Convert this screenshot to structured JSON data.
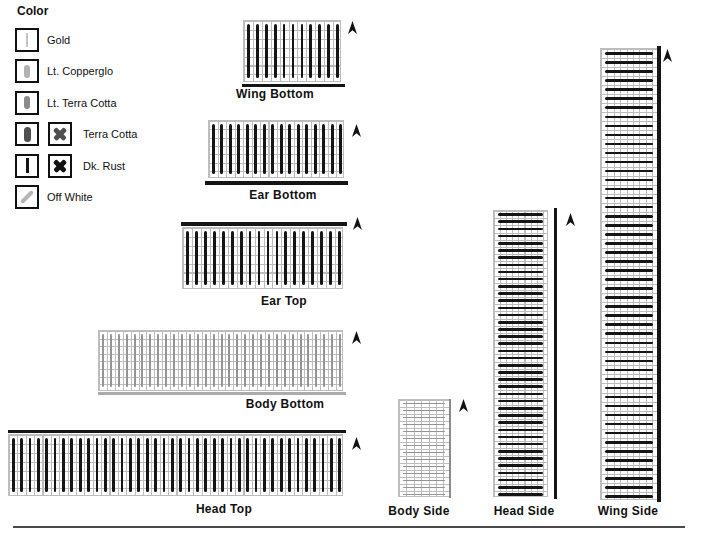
{
  "colors": {
    "background": "#ffffff",
    "text": "#111111",
    "gridline": "#bdbdbd",
    "black_bar": "#151515",
    "light_bar": "#949494",
    "rule": "#4a4a4a",
    "arrow": "#121212"
  },
  "legend": {
    "title": "Color",
    "items": [
      {
        "label": "Gold",
        "swatch": "thin-line",
        "swatch_color": "#c4c4c4",
        "has_x": false
      },
      {
        "label": "Lt. Copperglo",
        "swatch": "pill",
        "swatch_color": "#b3b3b3",
        "has_x": false
      },
      {
        "label": "Lt. Terra Cotta",
        "swatch": "pill",
        "swatch_color": "#8b8b8b",
        "has_x": false
      },
      {
        "label": "Terra Cotta",
        "swatch": "pill-bold",
        "swatch_color": "#4f4f4f",
        "has_x": true,
        "x_color": "#4f4f4f"
      },
      {
        "label": "Dk. Rust",
        "swatch": "bar",
        "swatch_color": "#151515",
        "has_x": true,
        "x_color": "#121212"
      },
      {
        "label": "Off White",
        "swatch": "diagonal",
        "swatch_color": "#b5b5b5",
        "has_x": false
      }
    ]
  },
  "panels": [
    {
      "id": "wing-bottom",
      "label": "Wing Bottom",
      "bar_axis": "vertical",
      "bars": 11,
      "bar_w": 2.8,
      "bar_color": "#151515",
      "grid": {
        "x": 243,
        "y": 20,
        "w": 98,
        "h": 62,
        "cell": 8.9
      },
      "edge_rect": {
        "x": 242,
        "y": 83.5,
        "w": 103,
        "h": 3.5
      },
      "edge_color": "#151515",
      "label_pos": {
        "cx": 275,
        "y": 87
      },
      "arrow": {
        "x": 348,
        "y": 21
      }
    },
    {
      "id": "ear-bottom",
      "label": "Ear Bottom",
      "bar_axis": "vertical",
      "bars": 16,
      "bar_w": 2.8,
      "bar_color": "#151515",
      "grid": {
        "x": 208,
        "y": 120,
        "w": 136,
        "h": 58,
        "cell": 8.3
      },
      "edge_rect": {
        "x": 205,
        "y": 180.5,
        "w": 143,
        "h": 4
      },
      "edge_color": "#151515",
      "label_pos": {
        "cx": 283,
        "y": 188
      },
      "arrow": {
        "x": 352,
        "y": 124
      }
    },
    {
      "id": "ear-top",
      "label": "Ear Top",
      "bar_axis": "vertical",
      "bars": 18,
      "bar_w": 2.8,
      "bar_color": "#151515",
      "grid": {
        "x": 182,
        "y": 227,
        "w": 161,
        "h": 62,
        "cell": 8.9
      },
      "edge_rect": {
        "x": 181,
        "y": 222,
        "w": 166,
        "h": 4
      },
      "edge_color": "#151515",
      "label_pos": {
        "cx": 284,
        "y": 294
      },
      "arrow": {
        "x": 353,
        "y": 217
      }
    },
    {
      "id": "body-bottom",
      "label": "Body Bottom",
      "bar_axis": "vertical",
      "bars": 31,
      "bar_w": 2,
      "bar_color": "#949494",
      "grid": {
        "x": 98,
        "y": 330,
        "w": 245,
        "h": 61,
        "cell": 7.6
      },
      "edge_rect": {
        "x": 98,
        "y": 392,
        "w": 248,
        "h": 2.5
      },
      "edge_color": "#ababab",
      "label_pos": {
        "cx": 285,
        "y": 397
      },
      "arrow": {
        "x": 352,
        "y": 331
      }
    },
    {
      "id": "head-top",
      "label": "Head Top",
      "bar_axis": "vertical",
      "bars": 40,
      "bar_w": 2.8,
      "bar_color": "#151515",
      "grid": {
        "x": 8,
        "y": 434,
        "w": 335,
        "h": 62,
        "cell": 8.9
      },
      "edge_rect": {
        "x": 8,
        "y": 429.5,
        "w": 338,
        "h": 3.5
      },
      "edge_color": "#151515",
      "label_pos": {
        "cx": 224,
        "y": 502
      },
      "arrow": {
        "x": 352,
        "y": 437
      }
    },
    {
      "id": "body-side",
      "label": "Body Side",
      "bar_axis": "horizontal",
      "bars": 14,
      "bar_w": 1.8,
      "bar_color": "#949494",
      "grid": {
        "x": 398,
        "y": 399,
        "w": 52,
        "h": 98,
        "cell": 7.4
      },
      "edge_rect": {
        "x": 449,
        "y": 399,
        "w": 2.2,
        "h": 99
      },
      "edge_color": "#8a8a8a",
      "label_pos": {
        "cx": 419,
        "y": 504
      },
      "arrow": {
        "x": 459,
        "y": 399
      }
    },
    {
      "id": "head-side",
      "label": "Head Side",
      "bar_axis": "horizontal",
      "bars": 40,
      "bar_w": 2.6,
      "bar_color": "#151515",
      "grid": {
        "x": 493,
        "y": 210,
        "w": 55,
        "h": 287,
        "cell": 6.1
      },
      "edge_rect": {
        "x": 553.5,
        "y": 208,
        "w": 3.5,
        "h": 291
      },
      "edge_color": "#151515",
      "label_pos": {
        "cx": 524,
        "y": 504
      },
      "arrow": {
        "x": 566,
        "y": 213
      }
    },
    {
      "id": "wing-side",
      "label": "Wing Side",
      "bar_axis": "horizontal",
      "bars": 50,
      "bar_w": 2.6,
      "bar_color": "#151515",
      "grid": {
        "x": 600,
        "y": 48,
        "w": 58,
        "h": 452,
        "cell": 6.4
      },
      "edge_rect": {
        "x": 657,
        "y": 46,
        "w": 3.5,
        "h": 456
      },
      "edge_color": "#151515",
      "label_pos": {
        "cx": 628,
        "y": 504
      },
      "arrow": {
        "x": 663,
        "y": 49
      }
    }
  ],
  "bottom_rule": {
    "x": 13,
    "y": 526,
    "w": 672,
    "h": 2
  }
}
